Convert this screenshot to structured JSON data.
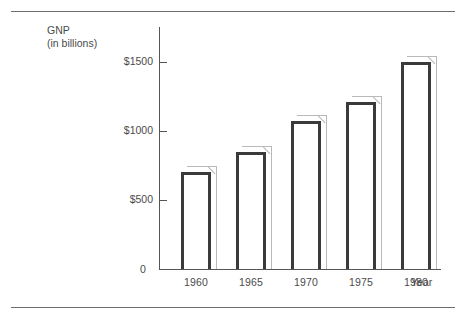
{
  "chart_data": {
    "type": "bar",
    "title": "",
    "subtitle": "",
    "ylabel": "GNP",
    "ylabel_sub": "(in billions)",
    "xlabel": "Year",
    "categories": [
      "1960",
      "1965",
      "1970",
      "1975",
      "1980"
    ],
    "values": [
      700,
      850,
      1070,
      1210,
      1500
    ],
    "ylim": [
      0,
      1750
    ],
    "ytick_values": [
      0,
      500,
      1000,
      1500
    ],
    "ytick_labels": [
      "0",
      "$500",
      "$1000",
      "$1500"
    ],
    "grid": false,
    "legend": false,
    "legend_position": "none",
    "annotations": [],
    "style": {
      "bar_face_color": "#ffffff",
      "bar_edge_color": "#3a3a3a",
      "bar_shadow_color": "#b9b9b9",
      "axis_color": "#555555",
      "text_color": "#4a4a4a",
      "rule_color": "#6e6e6e",
      "background": "#ffffff"
    }
  },
  "axis": {
    "y_title_line1": "GNP",
    "y_title_line2": "(in billions)",
    "x_title": "Year",
    "zero_label": "0"
  }
}
